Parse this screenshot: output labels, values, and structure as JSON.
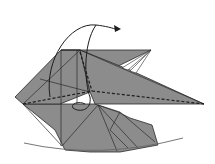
{
  "diagram": {
    "paper_color": "#8c8c8c",
    "line_color": "#2a2a2a",
    "arc_color": "#666666",
    "background": "#ffffff",
    "annotations": {
      "fold_arrow": "curved arrow indicating flap folds over to the right",
      "valley_fold": "dashed horizontal valley fold line",
      "rotation_guide": "arc beneath model indicating curvature"
    }
  }
}
